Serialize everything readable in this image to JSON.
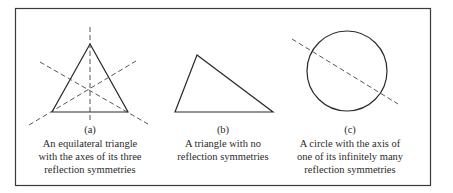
{
  "panels": [
    {
      "id": "a",
      "label": "(a)",
      "caption_lines": [
        "An equilateral triangle",
        "with the axes of its three",
        "reflection symmetries"
      ]
    },
    {
      "id": "b",
      "label": "(b)",
      "caption_lines": [
        "A triangle with no",
        "reflection symmetries"
      ]
    },
    {
      "id": "c",
      "label": "(c)",
      "caption_lines": [
        "A circle with the axis of",
        "one of its infinitely many",
        "reflection symmetries"
      ]
    }
  ],
  "colors": {
    "stroke": "#2a2a2a",
    "border": "#3a3a3a",
    "background": "#ffffff"
  }
}
